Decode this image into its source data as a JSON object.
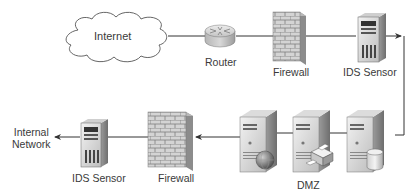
{
  "diagram": {
    "title": "",
    "nodes": [
      {
        "id": "internet",
        "label": "Internet",
        "type": "cloud"
      },
      {
        "id": "router",
        "label": "Router",
        "type": "router"
      },
      {
        "id": "firewall_outer",
        "label": "Firewall",
        "type": "firewall"
      },
      {
        "id": "ids_outer",
        "label": "IDS Sensor",
        "type": "server-tower"
      },
      {
        "id": "dmz_web",
        "label": "",
        "type": "server-web",
        "group": "DMZ"
      },
      {
        "id": "dmz_print",
        "label": "",
        "type": "server-print",
        "group": "DMZ"
      },
      {
        "id": "dmz_db",
        "label": "",
        "type": "server-database",
        "group": "DMZ"
      },
      {
        "id": "firewall_inner",
        "label": "Firewall",
        "type": "firewall"
      },
      {
        "id": "ids_inner",
        "label": "IDS Sensor",
        "type": "server-tower"
      },
      {
        "id": "internal",
        "label": "Internal\nNetwork",
        "type": "text-endpoint"
      }
    ],
    "groups": [
      {
        "id": "dmz",
        "label": "DMZ"
      }
    ],
    "edges": [
      {
        "from": "internet",
        "to": "router",
        "arrow": false
      },
      {
        "from": "router",
        "to": "firewall_outer",
        "arrow": false
      },
      {
        "from": "firewall_outer",
        "to": "ids_outer",
        "arrow": false
      },
      {
        "from": "ids_outer",
        "to": "dmz_db",
        "arrow": true,
        "route": "right-then-down"
      },
      {
        "from": "dmz_db",
        "to": "dmz_print",
        "arrow": false
      },
      {
        "from": "dmz_print",
        "to": "dmz_web",
        "arrow": false
      },
      {
        "from": "dmz_web",
        "to": "firewall_inner",
        "arrow": true
      },
      {
        "from": "firewall_inner",
        "to": "ids_inner",
        "arrow": false
      },
      {
        "from": "ids_inner",
        "to": "internal",
        "arrow": true
      }
    ]
  },
  "labels": {
    "internet": "Internet",
    "router": "Router",
    "firewall_top": "Firewall",
    "ids_top": "IDS Sensor",
    "dmz": "DMZ",
    "firewall_bottom": "Firewall",
    "ids_bottom": "IDS Sensor",
    "internal_network": "Internal\nNetwork"
  },
  "colors": {
    "line": "#333333",
    "text": "#3a3a3a",
    "server_light": "#e6e6e6",
    "server_dark": "#8a8a8a",
    "brick": "#cfcfcf"
  }
}
